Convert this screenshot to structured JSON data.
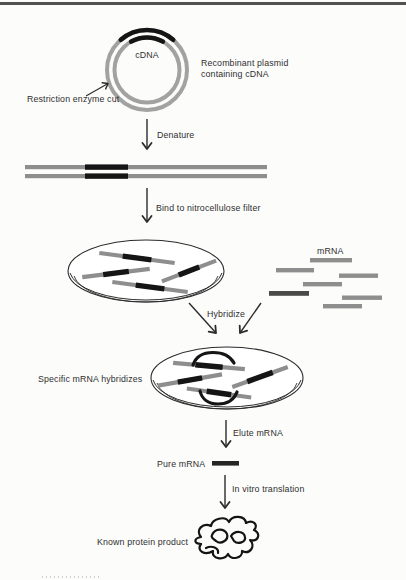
{
  "figure": {
    "title_none_shown": "",
    "plasmid": {
      "insert_label": "cDNA",
      "caption": "Recombinant plasmid containing cDNA",
      "cut_label": "Restriction enzyme cut"
    },
    "steps": {
      "denature": "Denature",
      "bind": "Bind to nitrocellulose filter",
      "hybridize": "Hybridize",
      "elute": "Elute mRNA",
      "translate": "In vitro translation"
    },
    "mrna_pool_label": "mRNA",
    "specific_label": "Specific mRNA hybridizes",
    "pure_label": "Pure mRNA",
    "product_label": "Known protein product"
  },
  "colors": {
    "strand_gray": "#8e8e8e",
    "strand_black": "#151515",
    "plasmid_ring_gray": "#a2a2a2",
    "specific_mrna_dark": "#4a4a4a",
    "arrow": "#2b2b2b",
    "text": "#2f2f2f",
    "top_rule": "#515151",
    "background": "#fcfcfb"
  }
}
